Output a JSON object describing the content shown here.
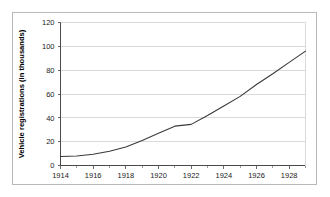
{
  "chart_data": {
    "type": "line",
    "title": "",
    "xlabel": "",
    "ylabel": "Vehicle registrations (in thousands)",
    "xlim": [
      1914,
      1929
    ],
    "ylim": [
      0,
      120
    ],
    "grid": true,
    "legend": "none",
    "x_tick_labels": [
      "1914",
      "1916",
      "1918",
      "1920",
      "1922",
      "1924",
      "1926",
      "1928"
    ],
    "x_ticks": [
      1914,
      1916,
      1918,
      1920,
      1922,
      1924,
      1926,
      1928
    ],
    "x_minor_ticks": [
      1915,
      1917,
      1919,
      1921,
      1923,
      1925,
      1927,
      1929
    ],
    "y_tick_labels": [
      "0",
      "20",
      "40",
      "60",
      "80",
      "100",
      "120"
    ],
    "y_ticks": [
      0,
      20,
      40,
      60,
      80,
      100,
      120
    ],
    "x": [
      1914,
      1915,
      1916,
      1917,
      1918,
      1919,
      1920,
      1921,
      1922,
      1923,
      1924,
      1925,
      1926,
      1927,
      1928,
      1929
    ],
    "values": [
      7.5,
      8,
      9.5,
      12,
      15.5,
      21,
      27,
      33,
      34.5,
      42,
      50,
      58,
      68,
      77,
      86.5,
      96
    ],
    "series_name": "Vehicle registrations",
    "line_color": "#3a3a3a",
    "grid_color": "#dadada",
    "axis_color": "#4a4a4a",
    "background_color": "#ffffff",
    "frame_color": "#b9b9b9"
  }
}
